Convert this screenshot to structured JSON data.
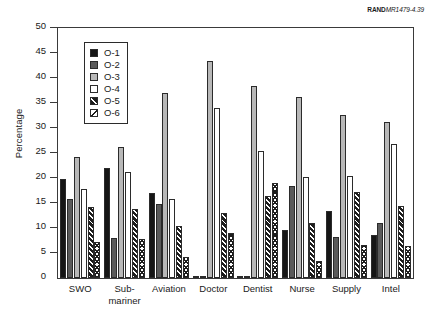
{
  "source_credit": {
    "brand": "RAND",
    "document": "MR1479-4.39"
  },
  "chart_data": {
    "type": "bar",
    "title": "",
    "subtitle": "",
    "xlabel": "",
    "ylabel": "Percentage",
    "ylim": [
      0,
      50
    ],
    "ytick_step": 5,
    "yticks": [
      0,
      5,
      10,
      15,
      20,
      25,
      30,
      35,
      40,
      45,
      50
    ],
    "ytick_labels": [
      "0",
      "5",
      "10",
      "15",
      "20",
      "25",
      "30",
      "35",
      "40",
      "45",
      "50"
    ],
    "grid": false,
    "legend_position": "upper-left-inside",
    "categories": [
      "SWO",
      "Sub-\nmariner",
      "Aviation",
      "Doctor",
      "Dentist",
      "Nurse",
      "Supply",
      "Intel"
    ],
    "series": [
      {
        "name": "O-1",
        "color": "#161616",
        "values": [
          19.9,
          22.0,
          17.1,
          0.0,
          0.0,
          9.6,
          13.4,
          8.7
        ]
      },
      {
        "name": "O-2",
        "color": "#5a5a5a",
        "values": [
          15.9,
          8.1,
          14.8,
          0.0,
          0.0,
          18.5,
          8.3,
          11.1
        ]
      },
      {
        "name": "O-3",
        "color": "#b8b8b8",
        "values": [
          24.2,
          26.3,
          37.0,
          43.5,
          38.5,
          36.2,
          32.6,
          31.2
        ]
      },
      {
        "name": "O-4",
        "color": "#ffffff",
        "values": [
          17.9,
          21.2,
          15.8,
          34.0,
          25.4,
          20.3,
          20.4,
          26.8
        ]
      },
      {
        "name": "O-5",
        "color": "#1d1d1d",
        "values": [
          14.3,
          13.8,
          10.5,
          13.1,
          16.4,
          11.0,
          17.3,
          14.5
        ]
      },
      {
        "name": "O-6",
        "color": "#ffffff",
        "values": [
          7.3,
          7.9,
          4.2,
          9.0,
          19.1,
          3.5,
          6.6,
          6.5
        ]
      }
    ]
  },
  "legend": {
    "entries": [
      "O-1",
      "O-2",
      "O-3",
      "O-4",
      "O-5",
      "O-6"
    ]
  }
}
